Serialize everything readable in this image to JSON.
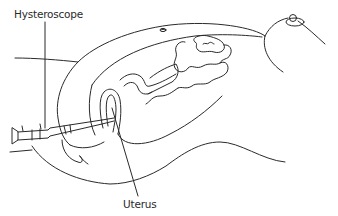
{
  "diagram": {
    "type": "anatomical-line-illustration",
    "line_color": "#2a2a2a",
    "background_color": "#ffffff",
    "labels": {
      "hysteroscope": "Hysteroscope",
      "uterus": "Uterus"
    },
    "elements": [
      {
        "name": "torso-outline",
        "description": "outer body contour from pelvis to chest"
      },
      {
        "name": "abdominal-wall",
        "description": "inner abdominal cavity contour"
      },
      {
        "name": "navel",
        "description": "small umbilicus mark on upper abdomen"
      },
      {
        "name": "breast",
        "description": "breast with nipple at upper right"
      },
      {
        "name": "intestines",
        "description": "coiled bowel loops in abdominal cavity"
      },
      {
        "name": "uterus",
        "description": "uterus with cervical canal"
      },
      {
        "name": "hysteroscope",
        "description": "rigid scope inserted through vagina into uterus"
      },
      {
        "name": "thigh",
        "description": "thigh and leg contour at bottom"
      }
    ],
    "callouts": [
      {
        "label": "Hysteroscope",
        "anchor": "top-left",
        "leader": "vertical line down to scope body"
      },
      {
        "label": "Uterus",
        "anchor": "bottom-center",
        "leader": "diagonal line up to uterus"
      }
    ]
  }
}
